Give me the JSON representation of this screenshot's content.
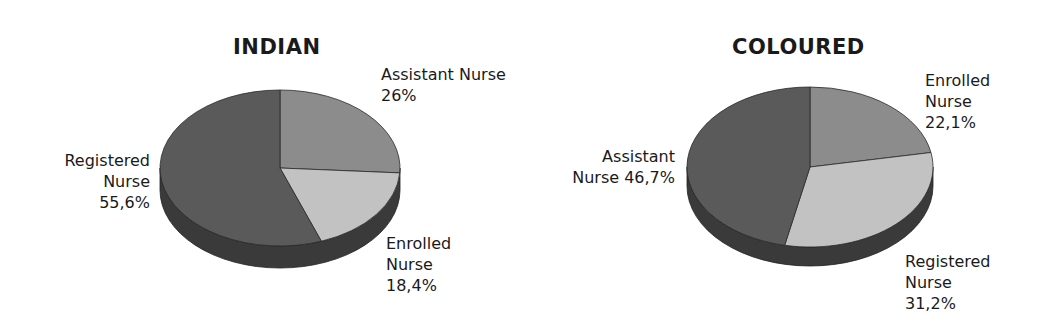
{
  "chart_data": [
    {
      "type": "pie",
      "title": "INDIAN",
      "slices": [
        {
          "label": "Assistant Nurse",
          "value": 26.0,
          "display": "26%"
        },
        {
          "label": "Enrolled Nurse",
          "value": 18.4,
          "display": "18,4%"
        },
        {
          "label": "Registered Nurse",
          "value": 55.6,
          "display": "55,6%"
        }
      ],
      "style": "3d-pie",
      "start_angle": "12 o'clock, clockwise"
    },
    {
      "type": "pie",
      "title": "COLOURED",
      "slices": [
        {
          "label": "Enrolled Nurse",
          "value": 22.1,
          "display": "22,1%"
        },
        {
          "label": "Registered Nurse",
          "value": 31.2,
          "display": "31,2%"
        },
        {
          "label": "Assistant Nurse",
          "value": 46.7,
          "display": "46,7%"
        }
      ],
      "style": "3d-pie",
      "start_angle": "12 o'clock, clockwise"
    }
  ],
  "colors": {
    "assistant_indian": "#8c8c8c",
    "enrolled_indian": "#c2c2c2",
    "registered_indian": "#5a5a5a",
    "enrolled_coloured": "#8c8c8c",
    "registered_coloured": "#c2c2c2",
    "assistant_coloured": "#5a5a5a",
    "side": "#3a3a3a"
  },
  "indian": {
    "title": "INDIAN",
    "assistant": {
      "line1": "Assistant Nurse",
      "line2": "26%"
    },
    "enrolled": {
      "line1": "Enrolled",
      "line2": "Nurse",
      "line3": "18,4%"
    },
    "registered": {
      "line1": "Registered",
      "line2": "Nurse",
      "line3": "55,6%"
    }
  },
  "coloured": {
    "title": "COLOURED",
    "enrolled": {
      "line1": "Enrolled",
      "line2": "Nurse",
      "line3": "22,1%"
    },
    "assistant": {
      "line1": "Assistant",
      "line2": "Nurse 46,7%"
    },
    "registered": {
      "line1": "Registered",
      "line2": "Nurse",
      "line3": "31,2%"
    }
  }
}
